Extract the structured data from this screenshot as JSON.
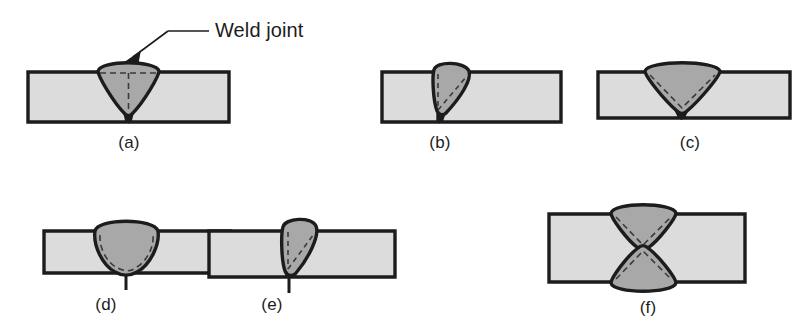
{
  "figure": {
    "background_color": "#ffffff",
    "width": 806,
    "height": 335
  },
  "colors": {
    "plate_fill": "#dcdcdc",
    "weld_fill": "#a8a8a8",
    "outline": "#1c1c1c",
    "dashed_line": "#3a3a3a",
    "text": "#1c1c1c"
  },
  "callout": {
    "label": "Weld joint",
    "icon": "arrow-down-left-icon",
    "target_panel": "a"
  },
  "panels": [
    {
      "id": "a",
      "label": "(a)",
      "description": "Symmetric V-shaped weld bead, full penetration, horizontal dashed surface line and vertical dashed centerline"
    },
    {
      "id": "b",
      "label": "(b)",
      "description": "Narrow asymmetric weld bead leaning right, joint line at left edge, dashed diagonal fusion boundary"
    },
    {
      "id": "c",
      "label": "(c)",
      "description": "Wide V weld bead, full penetration, dashed V fusion boundary inside bead"
    },
    {
      "id": "d",
      "label": "(d)",
      "description": "Shallow wide U-shaped weld bead, partial penetration, dashed U fusion boundary"
    },
    {
      "id": "e",
      "label": "(e)",
      "description": "Narrow asymmetric weld bead leaning right, partial penetration, dashed boundary"
    },
    {
      "id": "f",
      "label": "(f)",
      "description": "Double-sided hourglass weld, two mirrored V beads from top and bottom meeting at center"
    }
  ]
}
